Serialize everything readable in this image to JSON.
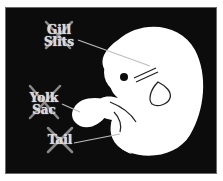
{
  "diagram": {
    "type": "embryo illustration with crossed-out labels",
    "colors": {
      "background": "#0c0c0c",
      "embryo": "#ffffff",
      "label_text": "#d8d8d8",
      "cross": "#8a8a8a",
      "pointer_line": "#bdbdbd"
    },
    "labels": [
      {
        "id": "gill-slits",
        "line1": "Gill",
        "line2": "Slits",
        "crossed_out": true
      },
      {
        "id": "yolk-sac",
        "line1": "Yolk",
        "line2": "Sac",
        "crossed_out": true
      },
      {
        "id": "tail",
        "line1": "Tail",
        "line2": "",
        "crossed_out": true
      }
    ]
  }
}
